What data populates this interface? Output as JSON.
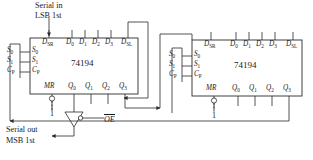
{
  "diagram": {
    "colors": {
      "wire": "#2a2a2a",
      "background": "#ffffff",
      "text": "#1a1a1a"
    }
  },
  "annotations": {
    "serial_in_line1": "Serial in",
    "serial_in_line2": "LSB 1st",
    "serial_out_line1": "Serial out",
    "serial_out_line2": "MSB 1st",
    "output_enable": "OE"
  },
  "chips": [
    {
      "id": "chip-left",
      "part_number": "74194",
      "top_pins": [
        {
          "name": "D_SR",
          "label": "D",
          "sub": "SR"
        },
        {
          "name": "D0",
          "label": "D",
          "sub": "0"
        },
        {
          "name": "D1",
          "label": "D",
          "sub": "1"
        },
        {
          "name": "D2",
          "label": "D",
          "sub": "2"
        },
        {
          "name": "D3",
          "label": "D",
          "sub": "3"
        },
        {
          "name": "D_SL",
          "label": "D",
          "sub": "SL"
        }
      ],
      "left_pins": [
        {
          "name": "S0",
          "label": "S",
          "sub": "0"
        },
        {
          "name": "S1",
          "label": "S",
          "sub": "1"
        },
        {
          "name": "CP",
          "label": "C",
          "sub": "P"
        }
      ],
      "left_external_pins": [
        {
          "name": "S0",
          "label": "S",
          "sub": "0"
        },
        {
          "name": "S1",
          "label": "S",
          "sub": "1"
        },
        {
          "name": "CP",
          "label": "C",
          "sub": "P"
        }
      ],
      "bottom_pins": [
        {
          "name": "MR",
          "label": "MR",
          "sub": ""
        },
        {
          "name": "Q0",
          "label": "Q",
          "sub": "0"
        },
        {
          "name": "Q1",
          "label": "Q",
          "sub": "1"
        },
        {
          "name": "Q2",
          "label": "Q",
          "sub": "2"
        },
        {
          "name": "Q3",
          "label": "Q",
          "sub": "3"
        }
      ],
      "mr_tie_value": "1"
    },
    {
      "id": "chip-right",
      "part_number": "74194",
      "top_pins": [
        {
          "name": "D_SR",
          "label": "D",
          "sub": "SR"
        },
        {
          "name": "D0",
          "label": "D",
          "sub": "0"
        },
        {
          "name": "D1",
          "label": "D",
          "sub": "1"
        },
        {
          "name": "D2",
          "label": "D",
          "sub": "2"
        },
        {
          "name": "D3",
          "label": "D",
          "sub": "3"
        },
        {
          "name": "D_SL",
          "label": "D",
          "sub": "SL"
        }
      ],
      "left_pins": [
        {
          "name": "S0",
          "label": "S",
          "sub": "0"
        },
        {
          "name": "S1",
          "label": "S",
          "sub": "1"
        },
        {
          "name": "CP",
          "label": "C",
          "sub": "P"
        }
      ],
      "left_external_pins": [
        {
          "name": "S0",
          "label": "S",
          "sub": "0"
        },
        {
          "name": "S1",
          "label": "S",
          "sub": "1"
        },
        {
          "name": "CP",
          "label": "C",
          "sub": "P"
        }
      ],
      "bottom_pins": [
        {
          "name": "MR",
          "label": "MR",
          "sub": ""
        },
        {
          "name": "Q0",
          "label": "Q",
          "sub": "0"
        },
        {
          "name": "Q1",
          "label": "Q",
          "sub": "1"
        },
        {
          "name": "Q2",
          "label": "Q",
          "sub": "2"
        },
        {
          "name": "Q3",
          "label": "Q",
          "sub": "3"
        }
      ],
      "mr_tie_value": "1"
    }
  ]
}
